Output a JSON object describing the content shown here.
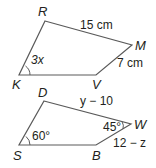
{
  "figures": [
    {
      "name": "quadrilateral-RMVK",
      "vertices": [
        "R",
        "M",
        "V",
        "K"
      ],
      "side_labels": {
        "RM": "15 cm",
        "MV": "7 cm"
      },
      "angle_labels": {
        "K": "3x"
      }
    },
    {
      "name": "quadrilateral-DWBS",
      "vertices": [
        "D",
        "W",
        "B",
        "S"
      ],
      "side_labels": {
        "DW": "y − 10",
        "WB": "12 − z"
      },
      "angle_labels": {
        "S": "60°",
        "W": "45°"
      }
    }
  ],
  "colors": {
    "line": "#5a5a5a",
    "text": "#231f20",
    "background": "#ffffff"
  }
}
